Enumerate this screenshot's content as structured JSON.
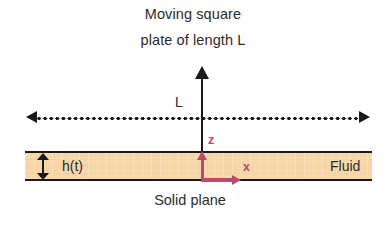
{
  "figure": {
    "title_line_1": "Moving square",
    "title_line_2": "plate of length L",
    "caption": "Solid plane",
    "labels": {
      "plate_length": "L",
      "film_thickness": "h(t)",
      "fluid_region": "Fluid",
      "axis_z": "z",
      "axis_x": "x"
    },
    "icons": {
      "plate_motion_arrow": "up-arrow-icon",
      "span_line": "double-headed-dotted-arrow-icon",
      "thickness_arrow": "vertical-double-arrow-icon",
      "axis_z_arrow": "axis-up-arrow-icon",
      "axis_x_arrow": "axis-right-arrow-icon"
    },
    "colors": {
      "background": "#ffffff",
      "ink": "#1a1a1a",
      "text": "#2b2b2b",
      "fluid_fill": "#f7d7a9",
      "axis_accent": "#c0486c"
    }
  }
}
